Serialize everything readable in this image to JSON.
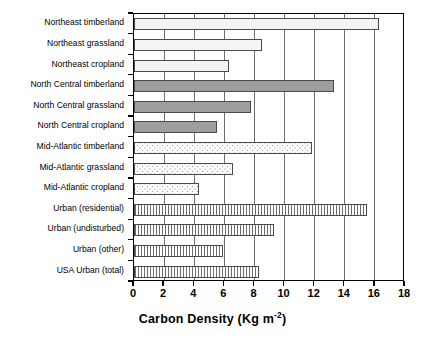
{
  "chart_data": {
    "type": "bar",
    "orientation": "horizontal",
    "title": "",
    "xlabel": "Carbon Density (Kg m-2)",
    "xlabel_base": "Carbon Density (Kg m",
    "xlabel_sup": "-2",
    "xlabel_tail": ")",
    "ylabel": "",
    "xlim": [
      0,
      18
    ],
    "xticks": [
      0,
      2,
      4,
      6,
      8,
      10,
      12,
      14,
      16,
      18
    ],
    "grid": true,
    "legend": "none",
    "categories": [
      "Northeast timberland",
      "Northeast grassland",
      "Northeast cropland",
      "North Central timberland",
      "North Central grassland",
      "North Central cropland",
      "Mid-Atlantic timberland",
      "Mid-Atlantic grassland",
      "Mid-Atlantic cropland",
      "Urban (residential)",
      "Urban (undisturbed)",
      "Urban (other)",
      "USA Urban (total)"
    ],
    "values": [
      16.3,
      8.5,
      6.3,
      13.3,
      7.8,
      5.5,
      11.8,
      6.6,
      4.3,
      15.5,
      9.3,
      5.9,
      8.3
    ],
    "groups": [
      "northeast",
      "northeast",
      "northeast",
      "north-central",
      "north-central",
      "north-central",
      "mid-atlantic",
      "mid-atlantic",
      "mid-atlantic",
      "urban",
      "urban",
      "urban",
      "urban"
    ]
  },
  "colors": {
    "axis": "#000000",
    "gridline": "#6f6f6f",
    "bar_outline": "#4a4a4a",
    "northeast_fill": "#f4f4f2",
    "north_central_fill": "#9e9e9e",
    "mid_atlantic_fill": "#fbfbfa",
    "urban_fill": "#f2f2f0",
    "background": "#ffffff"
  }
}
